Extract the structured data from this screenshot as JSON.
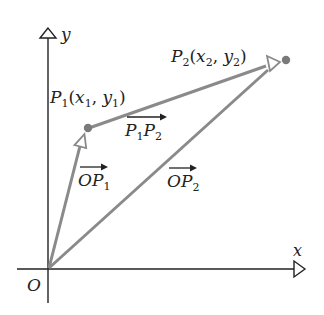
{
  "diagram": {
    "colors": {
      "axis": "#222222",
      "vector": "#8a8a8a",
      "point": "#7a7a7a",
      "text": "#222222"
    },
    "axes": {
      "x_label": "x",
      "y_label": "y",
      "origin_label": "O"
    },
    "points": [
      {
        "id": "P1",
        "name": "P",
        "sub": "1",
        "coord_open": "(",
        "x": "x",
        "x_sub": "1",
        "sep": ", ",
        "y": "y",
        "y_sub": "1",
        "coord_close": ")"
      },
      {
        "id": "P2",
        "name": "P",
        "sub": "2",
        "coord_open": "(",
        "x": "x",
        "x_sub": "2",
        "sep": ", ",
        "y": "y",
        "y_sub": "2",
        "coord_close": ")"
      }
    ],
    "vectors": [
      {
        "id": "OP1",
        "label_main": "OP",
        "label_sub": "1"
      },
      {
        "id": "OP2",
        "label_main": "OP",
        "label_sub": "2"
      },
      {
        "id": "P1P2",
        "label_a": "P",
        "label_a_sub": "1",
        "label_b": "P",
        "label_b_sub": "2"
      }
    ]
  }
}
